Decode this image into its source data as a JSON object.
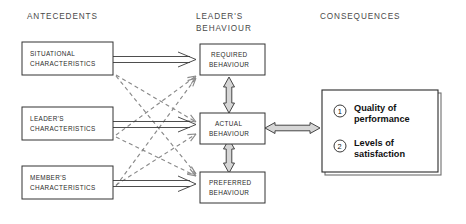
{
  "diagram": {
    "columns": [
      {
        "id": "antecedents",
        "label": "ANTECEDENTS"
      },
      {
        "id": "leaders-behaviour",
        "label_line1": "LEADER'S",
        "label_line2": "BEHAVIOUR"
      },
      {
        "id": "consequences",
        "label": "CONSEQUENCES"
      }
    ],
    "antecedent_boxes": [
      {
        "id": "situational-characteristics",
        "line1": "SITUATIONAL",
        "line2": "CHARACTERISTICS"
      },
      {
        "id": "leaders-characteristics",
        "line1": "LEADER'S",
        "line2": "CHARACTERISTICS"
      },
      {
        "id": "members-characteristics",
        "line1": "MEMBER'S",
        "line2": "CHARACTERISTICS"
      }
    ],
    "behaviour_boxes": [
      {
        "id": "required-behaviour",
        "line1": "REQUIRED",
        "line2": "BEHAVIOUR"
      },
      {
        "id": "actual-behaviour",
        "line1": "ACTUAL",
        "line2": "BEHAVIOUR"
      },
      {
        "id": "preferred-behaviour",
        "line1": "PREFERRED",
        "line2": "BEHAVIOUR"
      }
    ],
    "consequences_items": [
      {
        "id": "quality-of-performance",
        "number": "1",
        "line1": "Quality of",
        "line2": "performance"
      },
      {
        "id": "levels-of-satisfaction",
        "number": "2",
        "line1": "Levels of",
        "line2": "satisfaction"
      }
    ],
    "colors": {
      "box_stroke": "#333333",
      "solid_arrow": "#3a3a3a",
      "dashed_arrow": "#8a8a8a",
      "hollow_arrow_fill": "#d6d6d6",
      "heading_text": "#4a4a4a",
      "background": "#ffffff"
    }
  }
}
